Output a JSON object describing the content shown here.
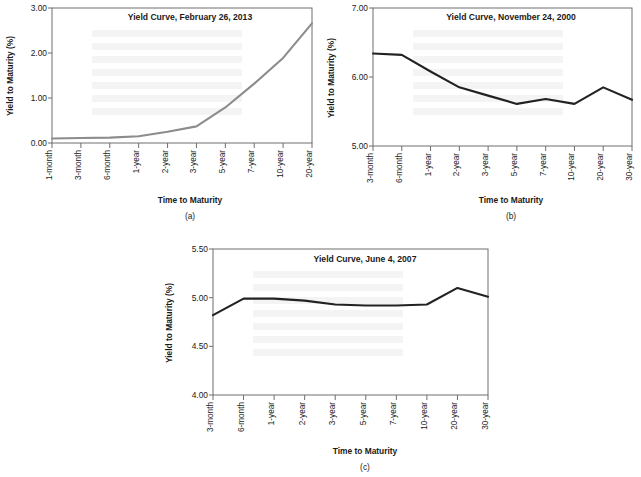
{
  "figure": {
    "axis_title": "Time to Maturity",
    "y_axis_title": "Yield to Maturity (%)",
    "panel_labels": {
      "a": "(a)",
      "b": "(b)",
      "c": "(c)"
    },
    "line_colors": {
      "gray": "#8c8c8c",
      "dark": "#222222"
    }
  },
  "chart_data": [
    {
      "id": "a",
      "type": "line",
      "title": "Yield Curve, February 26, 2013",
      "xlabel": "Time to Maturity",
      "ylabel": "Yield to Maturity (%)",
      "ylim": [
        0.0,
        3.0
      ],
      "yticks": [
        0.0,
        1.0,
        2.0,
        3.0
      ],
      "ytick_labels": [
        "0.00",
        "1.00",
        "2.00",
        "3.00"
      ],
      "grid": false,
      "legend": "none",
      "categories": [
        "1-month",
        "3-month",
        "6-month",
        "1-year",
        "2-year",
        "3-year",
        "5-year",
        "7-year",
        "10-year",
        "20-year"
      ],
      "values": [
        0.1,
        0.11,
        0.12,
        0.15,
        0.25,
        0.37,
        0.79,
        1.32,
        1.89,
        2.66
      ],
      "series": [
        {
          "name": "Yield to Maturity",
          "color": "#8c8c8c",
          "values": [
            0.1,
            0.11,
            0.12,
            0.15,
            0.25,
            0.37,
            0.79,
            1.32,
            1.89,
            2.66
          ]
        }
      ]
    },
    {
      "id": "b",
      "type": "line",
      "title": "Yield Curve, November 24, 2000",
      "xlabel": "Time to Maturity",
      "ylabel": "Yield to Maturity (%)",
      "ylim": [
        5.0,
        7.0
      ],
      "yticks": [
        5.0,
        6.0,
        7.0
      ],
      "ytick_labels": [
        "5.00",
        "6.00",
        "7.00"
      ],
      "grid": false,
      "legend": "none",
      "categories": [
        "3-month",
        "6-month",
        "1-year",
        "2-year",
        "3-year",
        "5-year",
        "7-year",
        "10-year",
        "20-year",
        "30-year"
      ],
      "values": [
        6.34,
        6.32,
        6.08,
        5.85,
        5.73,
        5.61,
        5.68,
        5.61,
        5.85,
        5.67
      ],
      "series": [
        {
          "name": "Yield to Maturity",
          "color": "#222222",
          "values": [
            6.34,
            6.32,
            6.08,
            5.85,
            5.73,
            5.61,
            5.68,
            5.61,
            5.85,
            5.67
          ]
        }
      ]
    },
    {
      "id": "c",
      "type": "line",
      "title": "Yield Curve, June 4, 2007",
      "xlabel": "Time to Maturity",
      "ylabel": "Yield to Maturity (%)",
      "ylim": [
        4.0,
        5.5
      ],
      "yticks": [
        4.0,
        4.5,
        5.0,
        5.5
      ],
      "ytick_labels": [
        "4.00",
        "4.50",
        "5.00",
        "5.50"
      ],
      "grid": false,
      "legend": "none",
      "categories": [
        "3-month",
        "6-month",
        "1-year",
        "2-year",
        "3-year",
        "5-year",
        "7-year",
        "10-year",
        "20-year",
        "30-year"
      ],
      "values": [
        4.82,
        4.99,
        4.99,
        4.97,
        4.93,
        4.92,
        4.92,
        4.93,
        5.1,
        5.01
      ],
      "series": [
        {
          "name": "Yield to Maturity",
          "color": "#222222",
          "values": [
            4.82,
            4.99,
            4.99,
            4.97,
            4.93,
            4.92,
            4.92,
            4.93,
            5.1,
            5.01
          ]
        }
      ]
    }
  ]
}
